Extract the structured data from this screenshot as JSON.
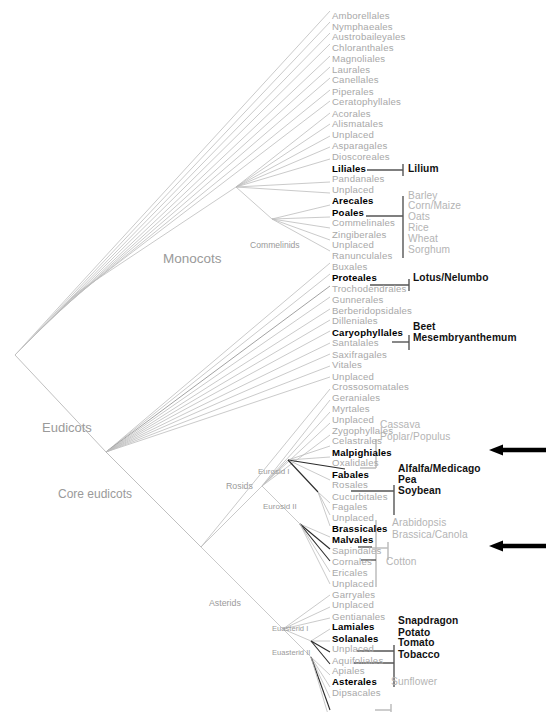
{
  "figure": {
    "type": "phylogenetic-cladogram",
    "background_color": "#ffffff",
    "order_label_color": "#a8a8a8",
    "order_label_highlight_color": "#000000",
    "crop_label_color": "#b4b4b4",
    "crop_label_highlight_color": "#111111",
    "branch_color": "#b9b9b9",
    "branch_highlight_color": "#1a1a1a",
    "arrow_color": "#000000"
  },
  "orders": [
    {
      "name": "Amborellales",
      "bold": false,
      "y": 14
    },
    {
      "name": "Nymphaeales",
      "bold": false,
      "y": 25
    },
    {
      "name": "Austrobaileyales",
      "bold": false,
      "y": 36
    },
    {
      "name": "Chloranthales",
      "bold": false,
      "y": 47
    },
    {
      "name": "Magnoliales",
      "bold": false,
      "y": 59
    },
    {
      "name": "Laurales",
      "bold": false,
      "y": 70
    },
    {
      "name": "Canellales",
      "bold": false,
      "y": 81
    },
    {
      "name": "Piperales",
      "bold": false,
      "y": 93
    },
    {
      "name": "Ceratophyllales",
      "bold": false,
      "y": 104
    },
    {
      "name": "Acorales",
      "bold": false,
      "y": 116
    },
    {
      "name": "Alismatales",
      "bold": false,
      "y": 127
    },
    {
      "name": "Unplaced",
      "bold": false,
      "y": 139
    },
    {
      "name": "Asparagales",
      "bold": false,
      "y": 150
    },
    {
      "name": "Dioscoreales",
      "bold": false,
      "y": 162
    },
    {
      "name": "Liliales",
      "bold": true,
      "y": 174
    },
    {
      "name": "Pandanales",
      "bold": false,
      "y": 185
    },
    {
      "name": "Unplaced",
      "bold": false,
      "y": 196
    },
    {
      "name": "Arecales",
      "bold": true,
      "y": 208
    },
    {
      "name": "Poales",
      "bold": true,
      "y": 220
    },
    {
      "name": "Commelinales",
      "bold": false,
      "y": 231
    },
    {
      "name": "Zingiberales",
      "bold": false,
      "y": 243
    },
    {
      "name": "Unplaced",
      "bold": false,
      "y": 254
    },
    {
      "name": "Ranunculales",
      "bold": false,
      "y": 266
    },
    {
      "name": "Buxales",
      "bold": false,
      "y": 277
    },
    {
      "name": "Proteales",
      "bold": true,
      "y": 289
    },
    {
      "name": "Trochodendrales",
      "bold": false,
      "y": 300
    },
    {
      "name": "Gunnerales",
      "bold": false,
      "y": 312
    },
    {
      "name": "Berberidopsidales",
      "bold": false,
      "y": 323
    },
    {
      "name": "Dilleniales",
      "bold": false,
      "y": 334
    },
    {
      "name": "Caryophyllales",
      "bold": true,
      "y": 346
    },
    {
      "name": "Santalales",
      "bold": false,
      "y": 357
    },
    {
      "name": "Saxifragales",
      "bold": false,
      "y": 369
    },
    {
      "name": "Vitales",
      "bold": false,
      "y": 380
    },
    {
      "name": "Unplaced",
      "bold": false,
      "y": 392
    },
    {
      "name": "Crossosomatales",
      "bold": false,
      "y": 403
    },
    {
      "name": "Geraniales",
      "bold": false,
      "y": 415
    },
    {
      "name": "Myrtales",
      "bold": false,
      "y": 426
    },
    {
      "name": "Unplaced",
      "bold": false,
      "y": 438
    },
    {
      "name": "Zygophyllales",
      "bold": false,
      "y": 449
    },
    {
      "name": "Celastrales",
      "bold": false,
      "y": 460
    },
    {
      "name": "Malpighiales",
      "bold": true,
      "y": 472
    },
    {
      "name": "Oxalidales",
      "bold": false,
      "y": 483
    },
    {
      "name": "Fabales",
      "bold": true,
      "y": 495
    },
    {
      "name": "Rosales",
      "bold": false,
      "y": 506
    },
    {
      "name": "Cucurbitales",
      "bold": false,
      "y": 518
    },
    {
      "name": "Fagales",
      "bold": false,
      "y": 529
    },
    {
      "name": "Unplaced",
      "bold": false,
      "y": 540
    },
    {
      "name": "Brassicales",
      "bold": true,
      "y": 552
    },
    {
      "name": "Malvales",
      "bold": true,
      "y": 564
    },
    {
      "name": "Sapindales",
      "bold": false,
      "y": 575
    },
    {
      "name": "Cornales",
      "bold": false,
      "y": 587
    },
    {
      "name": "Ericales",
      "bold": false,
      "y": 598
    },
    {
      "name": "Unplaced",
      "bold": false,
      "y": 610
    },
    {
      "name": "Garryales",
      "bold": false,
      "y": 621
    },
    {
      "name": "Unplaced",
      "bold": false,
      "y": 632
    },
    {
      "name": "Gentianales",
      "bold": false,
      "y": 644
    },
    {
      "name": "Lamiales",
      "bold": true,
      "y": 655
    },
    {
      "name": "Solanales",
      "bold": true,
      "y": 667
    },
    {
      "name": "Unplaced",
      "bold": false,
      "y": 678
    },
    {
      "name": "Aquifoliales",
      "bold": false,
      "y": 690
    },
    {
      "name": "Apiales",
      "bold": false,
      "y": 701
    },
    {
      "name": "Asterales",
      "bold": true,
      "y": 713
    },
    {
      "name": "Dipsacales",
      "bold": false,
      "y": 724
    }
  ],
  "crops": [
    {
      "name": "Lilium",
      "dark": true,
      "x": 408,
      "y": 174
    },
    {
      "name": "Barley",
      "dark": false,
      "x": 408,
      "y": 202
    },
    {
      "name": "Corn/Maize",
      "dark": false,
      "x": 408,
      "y": 213
    },
    {
      "name": "Oats",
      "dark": false,
      "x": 408,
      "y": 225
    },
    {
      "name": "Rice",
      "dark": false,
      "x": 408,
      "y": 236
    },
    {
      "name": "Wheat",
      "dark": false,
      "x": 408,
      "y": 248
    },
    {
      "name": "Sorghum",
      "dark": false,
      "x": 408,
      "y": 259
    },
    {
      "name": "Lotus/Nelumbo",
      "dark": true,
      "x": 413,
      "y": 289
    },
    {
      "name": "Beet",
      "dark": true,
      "x": 413,
      "y": 340
    },
    {
      "name": "Mesembryanthemum",
      "dark": true,
      "x": 413,
      "y": 351
    },
    {
      "name": "Cassava",
      "dark": false,
      "x": 380,
      "y": 443
    },
    {
      "name": "Poplar/Populus",
      "dark": false,
      "x": 380,
      "y": 455
    },
    {
      "name": "Alfalfa/Medicago",
      "dark": true,
      "x": 398,
      "y": 489
    },
    {
      "name": "Pea",
      "dark": true,
      "x": 398,
      "y": 501
    },
    {
      "name": "Soybean",
      "dark": true,
      "x": 398,
      "y": 512
    },
    {
      "name": "Arabidopsis",
      "dark": false,
      "x": 392,
      "y": 546
    },
    {
      "name": "Brassica/Canola",
      "dark": false,
      "x": 392,
      "y": 558
    },
    {
      "name": "Cotton",
      "dark": false,
      "x": 386,
      "y": 587
    },
    {
      "name": "Snapdragon",
      "dark": true,
      "x": 398,
      "y": 649
    },
    {
      "name": "Potato",
      "dark": true,
      "x": 398,
      "y": 661
    },
    {
      "name": "Tomato",
      "dark": true,
      "x": 398,
      "y": 672
    },
    {
      "name": "Tobacco",
      "dark": true,
      "x": 398,
      "y": 684
    },
    {
      "name": "Sunflower",
      "dark": false,
      "x": 391,
      "y": 713
    }
  ],
  "clades": [
    {
      "name": "Monocots",
      "x": 163,
      "y": 251,
      "size": 13.5
    },
    {
      "name": "Commelinids",
      "x": 250,
      "y": 240,
      "size": 8.6
    },
    {
      "name": "Eudicots",
      "x": 42,
      "y": 420,
      "size": 13.0
    },
    {
      "name": "Core eudicots",
      "x": 58,
      "y": 487,
      "size": 12.0
    },
    {
      "name": "Rosids",
      "x": 226,
      "y": 481,
      "size": 8.8
    },
    {
      "name": "Eurosid I",
      "x": 258,
      "y": 467,
      "size": 8.0
    },
    {
      "name": "Eurosid II",
      "x": 263,
      "y": 502,
      "size": 8.0
    },
    {
      "name": "Asterids",
      "x": 209,
      "y": 598,
      "size": 8.8
    },
    {
      "name": "Euasterid I",
      "x": 272,
      "y": 624,
      "size": 7.6
    },
    {
      "name": "Euasterid II",
      "x": 272,
      "y": 648,
      "size": 7.6
    }
  ],
  "arrows": [
    {
      "target": "Malpighiales",
      "y": 450,
      "x_start": 546,
      "x_end": 489
    },
    {
      "target": "Brassicales",
      "y": 546,
      "x_start": 546,
      "x_end": 489
    }
  ]
}
